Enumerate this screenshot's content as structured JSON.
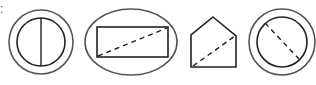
{
  "diagram": {
    "leading_text": ":",
    "stroke_color": "#222222",
    "outer_stroke_color": "#555555",
    "shapes": [
      {
        "name": "circle-in-ring-with-solid-diameter",
        "outer": "circle",
        "inner": "circle",
        "line": "solid vertical diameter"
      },
      {
        "name": "rectangle-in-ellipse-with-dashed-diagonal",
        "outer": "ellipse",
        "inner": "rectangle",
        "line": "dashed diagonal"
      },
      {
        "name": "house-pentagon-with-dashed-diagonal",
        "outer": "none",
        "inner": "pentagon",
        "line": "dashed diagonal"
      },
      {
        "name": "circle-in-ring-with-dashed-diameter",
        "outer": "circle",
        "inner": "circle",
        "line": "dashed diagonal diameter"
      }
    ]
  }
}
